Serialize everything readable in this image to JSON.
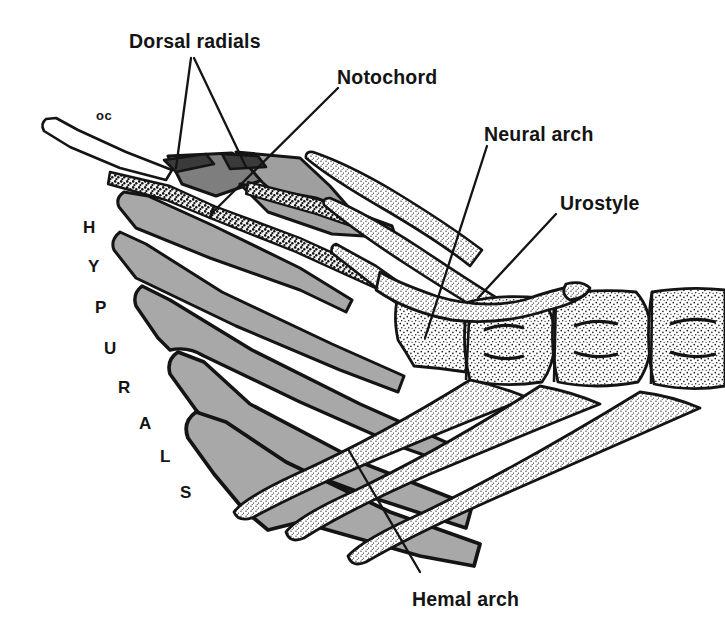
{
  "figure": {
    "kind": "anatomical-line-drawing",
    "background_color": "#ffffff",
    "ink_color": "#141414",
    "hypural_fill_color": "#a8a8a8",
    "stipple_fill_color": "#ffffff",
    "radial_fill_color": "#3a3a3a"
  },
  "labels": {
    "dorsal_radials": "Dorsal radials",
    "notochord": "Notochord",
    "neural_arch": "Neural arch",
    "urostyle": "Urostyle",
    "hemal_arch": "Hemal arch",
    "oc": "oc"
  },
  "hypurals": {
    "word": "HYPURALS",
    "letters": [
      {
        "char": "H",
        "x": 83,
        "y": 218
      },
      {
        "char": "Y",
        "x": 88,
        "y": 257
      },
      {
        "char": "P",
        "x": 95,
        "y": 298
      },
      {
        "char": "U",
        "x": 104,
        "y": 339
      },
      {
        "char": "R",
        "x": 118,
        "y": 378
      },
      {
        "char": "A",
        "x": 139,
        "y": 414
      },
      {
        "char": "L",
        "x": 160,
        "y": 447
      },
      {
        "char": "S",
        "x": 180,
        "y": 483
      }
    ]
  },
  "label_positions": {
    "dorsal_radials": {
      "x": 129,
      "y": 30
    },
    "notochord": {
      "x": 337,
      "y": 66
    },
    "neural_arch": {
      "x": 484,
      "y": 123
    },
    "urostyle": {
      "x": 560,
      "y": 192
    },
    "hemal_arch": {
      "x": 412,
      "y": 588
    },
    "oc": {
      "x": 96,
      "y": 108
    }
  },
  "leader_lines": [
    {
      "name": "dorsal-radials-left",
      "x1": 191,
      "y1": 58,
      "x2": 176,
      "y2": 168
    },
    {
      "name": "dorsal-radials-right",
      "x1": 194,
      "y1": 58,
      "x2": 246,
      "y2": 167
    },
    {
      "name": "notochord",
      "x1": 338,
      "y1": 88,
      "x2": 212,
      "y2": 213
    },
    {
      "name": "neural-arch",
      "x1": 487,
      "y1": 146,
      "x2": 425,
      "y2": 338
    },
    {
      "name": "urostyle",
      "x1": 556,
      "y1": 214,
      "x2": 478,
      "y2": 298
    },
    {
      "name": "hemal-arch",
      "x1": 420,
      "y1": 572,
      "x2": 348,
      "y2": 449
    }
  ],
  "chart_data": {
    "type": "diagram",
    "structures": [
      {
        "name": "Dorsal radials",
        "count": 2,
        "description": "small dark rod-shaped elements at anterodorsal margin"
      },
      {
        "name": "Notochord",
        "count": 1,
        "description": "thin stippled band running along the dorsal hypural margin"
      },
      {
        "name": "Neural arch",
        "count": 2,
        "description": "long tapering spines projecting anterodorsally from the centra"
      },
      {
        "name": "Urostyle",
        "count": 1,
        "description": "terminal upturned element above the last centra"
      },
      {
        "name": "Hemal arch",
        "count": 3,
        "description": "long tapering spines projecting anteroventrally"
      },
      {
        "name": "Hypurals",
        "count": 7,
        "description": "large gray fan-shaped plates forming the caudal fin support"
      },
      {
        "name": "oc",
        "count": 1,
        "description": "opisthural cartilage, unshaded blade at upper left"
      },
      {
        "name": "Vertebral centra",
        "count": 3,
        "description": "stippled hourglass-shaped vertebrae at right"
      }
    ]
  }
}
